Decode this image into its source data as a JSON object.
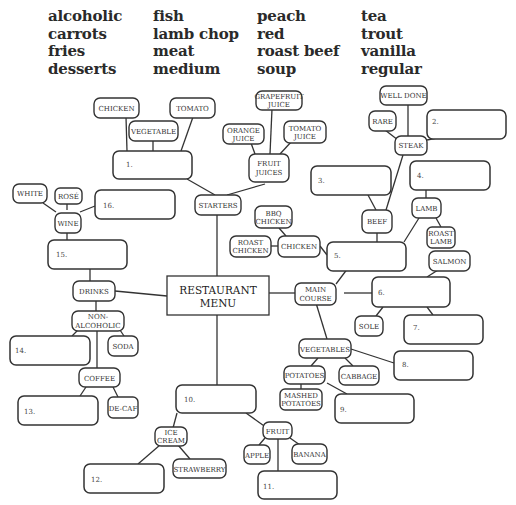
{
  "word_bank": {
    "columns": [
      [
        "alcoholic",
        "carrots",
        "fries",
        "desserts"
      ],
      [
        "fish",
        "lamb chop",
        "meat",
        "medium"
      ],
      [
        "peach",
        "red",
        "roast beef",
        "soup"
      ],
      [
        "tea",
        "trout",
        "vanilla",
        "regular"
      ]
    ]
  },
  "diagram": {
    "root": {
      "line1": "RESTAURANT",
      "line2": "MENU"
    },
    "nodes": {
      "starters": "STARTERS",
      "chicken_top": "CHICKEN",
      "tomato": "TOMATO",
      "vegetable": "VEGETABLE",
      "fruit_juices": {
        "line1": "FRUIT",
        "line2": "JUICES"
      },
      "orange_juice": {
        "line1": "ORANGE",
        "line2": "JUICE"
      },
      "grapefruit_juice": {
        "line1": "GRAPEFRUIT",
        "line2": "JUICE"
      },
      "tomato_juice": {
        "line1": "TOMATO",
        "line2": "JUICE"
      },
      "well_done": "WELL DONE",
      "rare": "RARE",
      "steak": "STEAK",
      "beef": "BEEF",
      "lamb": "LAMB",
      "roast_lamb": {
        "line1": "ROAST",
        "line2": "LAMB"
      },
      "salmon": "SALMON",
      "bbq_chicken": {
        "line1": "BBQ",
        "line2": "CHICKEN"
      },
      "roast_chicken": {
        "line1": "ROAST",
        "line2": "CHICKEN"
      },
      "chicken": "CHICKEN",
      "main_course": {
        "line1": "MAIN",
        "line2": "COURSE"
      },
      "sole": "SOLE",
      "vegetables": "VEGETABLES",
      "potatoes": "POTATOES",
      "cabbage": "CABBAGE",
      "mashed_potatoes": {
        "line1": "MASHED",
        "line2": "POTATOES"
      },
      "white": "WHITE",
      "rose": "ROSÉ",
      "wine": "WINE",
      "drinks": "DRINKS",
      "non_alcoholic": {
        "line1": "NON-",
        "line2": "ALCOHOLIC"
      },
      "soda": "SODA",
      "coffee": "COFFEE",
      "decaf": "DE-CAF",
      "ice_cream": {
        "line1": "ICE",
        "line2": "CREAM"
      },
      "strawberry": "STRAWBERRY",
      "fruit": "FRUIT",
      "apple": "APPLE",
      "banana": "BANANA"
    },
    "blanks": {
      "b1": "1.",
      "b2": "2.",
      "b3": "3.",
      "b4": "4.",
      "b5": "5.",
      "b6": "6.",
      "b7": "7.",
      "b8": "8.",
      "b9": "9.",
      "b10": "10.",
      "b11": "11.",
      "b12": "12.",
      "b13": "13.",
      "b14": "14.",
      "b15": "15.",
      "b16": "16."
    }
  }
}
